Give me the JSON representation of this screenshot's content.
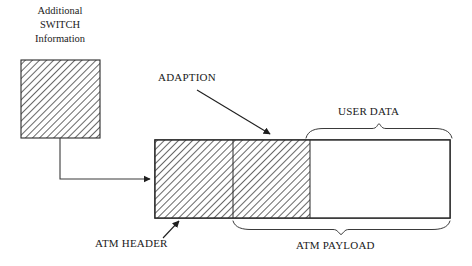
{
  "diagram": {
    "title_caption": "Additional\nSWITCH\nInformation",
    "background_color": "#ffffff",
    "line_color": "#2b2b2b",
    "hatch_color": "#555555",
    "labels": {
      "switch_box_caption_line1": "Additional",
      "switch_box_caption_line2": "SWITCH",
      "switch_box_caption_line3": "Information",
      "adaption": "ADAPTION",
      "user_data": "USER DATA",
      "atm_header": "ATM HEADER",
      "atm_payload": "ATM PAYLOAD"
    },
    "switch_box": {
      "name": "additional-switch-information-box",
      "x": 21,
      "y": 60,
      "width": 79,
      "height": 78,
      "fill": "hatched"
    },
    "cell": {
      "name": "atm-cell",
      "x": 155,
      "y": 140,
      "width": 295,
      "height": 78,
      "segments": [
        {
          "name": "atm-header-segment",
          "x": 155,
          "width": 78,
          "fill": "hatched"
        },
        {
          "name": "adaption-segment",
          "x": 233,
          "width": 77,
          "fill": "hatched"
        },
        {
          "name": "user-data-segment",
          "x": 310,
          "width": 140,
          "fill": "empty"
        }
      ]
    },
    "connector": {
      "name": "switch-to-header-connector",
      "from_x": 60,
      "from_y": 138,
      "elbow_y": 179,
      "to_x": 155
    },
    "adaption_arrow": {
      "name": "adaption-pointer-arrow",
      "x1": 197,
      "y1": 90,
      "x2": 273,
      "y2": 137
    },
    "header_arrow": {
      "name": "atm-header-pointer-arrow",
      "x1": 165,
      "y1": 237,
      "x2": 180,
      "y2": 220
    },
    "user_data_brace": {
      "name": "user-data-brace",
      "left": 306,
      "right": 452,
      "y": 136,
      "direction": "up"
    },
    "atm_payload_brace": {
      "name": "atm-payload-brace",
      "left": 233,
      "right": 450,
      "y": 222,
      "direction": "down"
    }
  }
}
